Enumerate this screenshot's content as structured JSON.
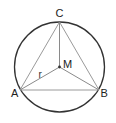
{
  "diagram": {
    "colors": {
      "circle": "#333333",
      "triangle": "#9a9a9a",
      "radii": "#8a8a8a",
      "label": "#222222",
      "center_dot": "#333333"
    },
    "circle": {
      "cx": 59.5,
      "cy": 67,
      "r": 45
    },
    "points": {
      "A": {
        "x": 20,
        "y": 90,
        "label": "A"
      },
      "B": {
        "x": 99,
        "y": 90,
        "label": "B"
      },
      "C": {
        "x": 59.5,
        "y": 22,
        "label": "C"
      },
      "M": {
        "x": 59.5,
        "y": 67,
        "label": "M"
      }
    },
    "labels": {
      "A": "A",
      "B": "B",
      "C": "C",
      "M": "M",
      "r": "r"
    },
    "segments": [
      {
        "from": "A",
        "to": "B",
        "kind": "triangle-side"
      },
      {
        "from": "B",
        "to": "C",
        "kind": "triangle-side"
      },
      {
        "from": "C",
        "to": "A",
        "kind": "triangle-side"
      },
      {
        "from": "M",
        "to": "A",
        "kind": "radius"
      },
      {
        "from": "M",
        "to": "B",
        "kind": "radius"
      },
      {
        "from": "M",
        "to": "C",
        "kind": "radius"
      }
    ]
  }
}
